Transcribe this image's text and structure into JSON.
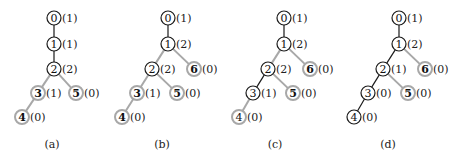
{
  "colors": {
    "active": "#1a1a1a",
    "inactive": "#a8a8a8",
    "text": "#1a1a1a"
  },
  "panels": [
    {
      "caption": "(a)",
      "caption_pos": [
        52,
        148
      ],
      "nodes": [
        {
          "id": "0",
          "count": "(1)",
          "x": 54,
          "y": 18,
          "state": "active"
        },
        {
          "id": "1",
          "count": "(1)",
          "x": 54,
          "y": 44,
          "state": "active"
        },
        {
          "id": "2",
          "count": "(2)",
          "x": 54,
          "y": 69,
          "state": "active"
        },
        {
          "id": "3",
          "count": "(1)",
          "x": 38,
          "y": 93,
          "state": "inactive"
        },
        {
          "id": "5",
          "count": "(0)",
          "x": 76,
          "y": 93,
          "state": "inactive"
        },
        {
          "id": "4",
          "count": "(0)",
          "x": 22,
          "y": 117,
          "state": "inactive"
        }
      ],
      "edges": [
        {
          "from": "0",
          "to": "1",
          "state": "active"
        },
        {
          "from": "1",
          "to": "2",
          "state": "active"
        },
        {
          "from": "2",
          "to": "3",
          "state": "inactive"
        },
        {
          "from": "2",
          "to": "5",
          "state": "inactive"
        },
        {
          "from": "3",
          "to": "4",
          "state": "inactive"
        }
      ]
    },
    {
      "caption": "(b)",
      "caption_pos": [
        162,
        148
      ],
      "nodes": [
        {
          "id": "0",
          "count": "(1)",
          "x": 168,
          "y": 18,
          "state": "active"
        },
        {
          "id": "1",
          "count": "(2)",
          "x": 168,
          "y": 44,
          "state": "active"
        },
        {
          "id": "2",
          "count": "(2)",
          "x": 152,
          "y": 69,
          "state": "active"
        },
        {
          "id": "6",
          "count": "(0)",
          "x": 194,
          "y": 69,
          "state": "inactive"
        },
        {
          "id": "3",
          "count": "(1)",
          "x": 137,
          "y": 93,
          "state": "inactive"
        },
        {
          "id": "5",
          "count": "(0)",
          "x": 177,
          "y": 93,
          "state": "inactive"
        },
        {
          "id": "4",
          "count": "(0)",
          "x": 122,
          "y": 117,
          "state": "inactive"
        }
      ],
      "edges": [
        {
          "from": "0",
          "to": "1",
          "state": "active"
        },
        {
          "from": "1",
          "to": "2",
          "state": "inactive"
        },
        {
          "from": "1",
          "to": "6",
          "state": "inactive"
        },
        {
          "from": "2",
          "to": "3",
          "state": "inactive"
        },
        {
          "from": "2",
          "to": "5",
          "state": "inactive"
        },
        {
          "from": "3",
          "to": "4",
          "state": "inactive"
        }
      ]
    },
    {
      "caption": "(c)",
      "caption_pos": [
        275,
        148
      ],
      "nodes": [
        {
          "id": "0",
          "count": "(1)",
          "x": 284,
          "y": 18,
          "state": "active"
        },
        {
          "id": "1",
          "count": "(2)",
          "x": 284,
          "y": 44,
          "state": "active"
        },
        {
          "id": "2",
          "count": "(2)",
          "x": 268,
          "y": 69,
          "state": "active"
        },
        {
          "id": "6",
          "count": "(0)",
          "x": 310,
          "y": 69,
          "state": "inactive"
        },
        {
          "id": "3",
          "count": "(1)",
          "x": 253,
          "y": 93,
          "state": "active"
        },
        {
          "id": "5",
          "count": "(0)",
          "x": 293,
          "y": 93,
          "state": "inactive"
        },
        {
          "id": "4",
          "count": "(0)",
          "x": 239,
          "y": 117,
          "state": "inactive-plain"
        }
      ],
      "edges": [
        {
          "from": "0",
          "to": "1",
          "state": "active"
        },
        {
          "from": "1",
          "to": "2",
          "state": "inactive"
        },
        {
          "from": "1",
          "to": "6",
          "state": "inactive"
        },
        {
          "from": "2",
          "to": "3",
          "state": "active"
        },
        {
          "from": "2",
          "to": "5",
          "state": "inactive"
        },
        {
          "from": "3",
          "to": "4",
          "state": "inactive"
        }
      ]
    },
    {
      "caption": "(d)",
      "caption_pos": [
        388,
        148
      ],
      "nodes": [
        {
          "id": "0",
          "count": "(1)",
          "x": 399,
          "y": 18,
          "state": "active"
        },
        {
          "id": "1",
          "count": "(2)",
          "x": 399,
          "y": 44,
          "state": "active"
        },
        {
          "id": "2",
          "count": "(1)",
          "x": 383,
          "y": 69,
          "state": "active"
        },
        {
          "id": "6",
          "count": "(0)",
          "x": 425,
          "y": 69,
          "state": "inactive"
        },
        {
          "id": "3",
          "count": "(0)",
          "x": 368,
          "y": 93,
          "state": "active"
        },
        {
          "id": "5",
          "count": "(0)",
          "x": 408,
          "y": 93,
          "state": "inactive"
        },
        {
          "id": "4",
          "count": "(0)",
          "x": 354,
          "y": 117,
          "state": "active"
        }
      ],
      "edges": [
        {
          "from": "0",
          "to": "1",
          "state": "active"
        },
        {
          "from": "1",
          "to": "2",
          "state": "active"
        },
        {
          "from": "1",
          "to": "6",
          "state": "inactive"
        },
        {
          "from": "2",
          "to": "3",
          "state": "active"
        },
        {
          "from": "2",
          "to": "5",
          "state": "inactive"
        },
        {
          "from": "3",
          "to": "4",
          "state": "active"
        }
      ]
    }
  ]
}
